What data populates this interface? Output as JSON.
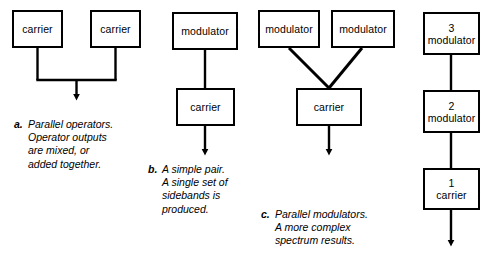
{
  "figure": {
    "line_color": "#000000",
    "box_fill": "#ffffff",
    "background": "#ffffff"
  },
  "groups": [
    {
      "id": "group-a",
      "nodes": [
        {
          "name": "carrier-box-left",
          "label": "carrier",
          "number": ""
        },
        {
          "name": "carrier-box-right",
          "label": "carrier",
          "number": ""
        }
      ],
      "caption": {
        "tag": "a.",
        "text": "Parallel operators.\nOperator outputs\nare mixed, or\nadded together."
      }
    },
    {
      "id": "group-b",
      "nodes": [
        {
          "name": "modulator-box",
          "label": "modulator",
          "number": ""
        },
        {
          "name": "carrier-box",
          "label": "carrier",
          "number": ""
        }
      ],
      "caption": {
        "tag": "b.",
        "text": "A simple pair.\nA single set of\nsidebands is\nproduced."
      }
    },
    {
      "id": "group-c",
      "nodes": [
        {
          "name": "modulator-box-left",
          "label": "modulator",
          "number": ""
        },
        {
          "name": "modulator-box-right",
          "label": "modulator",
          "number": ""
        },
        {
          "name": "carrier-box",
          "label": "carrier",
          "number": ""
        }
      ],
      "caption": {
        "tag": "c.",
        "text": "Parallel modulators.\nA more complex\nspectrum results."
      }
    },
    {
      "id": "group-d",
      "nodes": [
        {
          "name": "modulator-box-3",
          "label": "modulator",
          "number": "3"
        },
        {
          "name": "modulator-box-2",
          "label": "modulator",
          "number": "2"
        },
        {
          "name": "carrier-box-1",
          "label": "carrier",
          "number": "1"
        }
      ],
      "caption": {
        "tag": "",
        "text": ""
      }
    }
  ]
}
